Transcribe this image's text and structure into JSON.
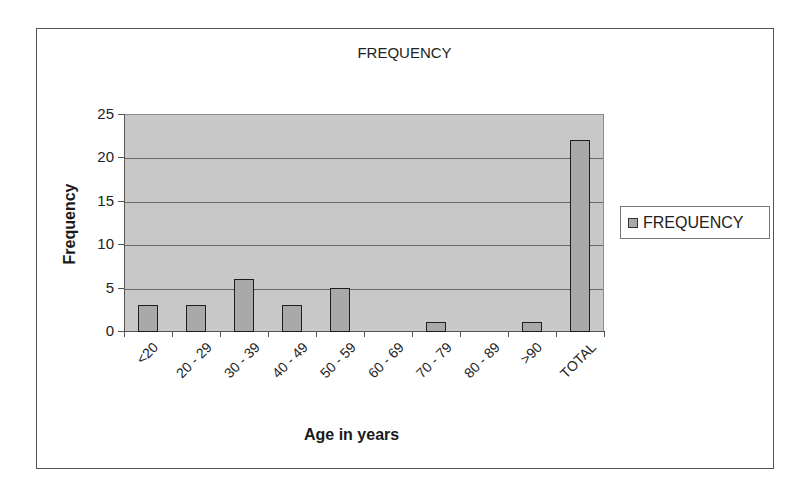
{
  "chart_data": {
    "type": "bar",
    "title": "FREQUENCY",
    "xlabel": "Age in years",
    "ylabel": "Frequency",
    "categories": [
      "<20",
      "20 - 29",
      "30 - 39",
      "40 - 49",
      "50 - 59",
      "60 - 69",
      "70 - 79",
      "80 - 89",
      ">90",
      "TOTAL"
    ],
    "series": [
      {
        "name": "FREQUENCY",
        "values": [
          3,
          3,
          6,
          3,
          5,
          0,
          1,
          0,
          1,
          22
        ]
      }
    ],
    "ylim": [
      0,
      25
    ],
    "yticks": [
      0,
      5,
      10,
      15,
      20,
      25
    ],
    "grid": true,
    "legend_position": "right",
    "colors": {
      "bar_fill": "#a9a9a9",
      "bar_border": "#1e1e1e",
      "plot_background": "#c8c8c8",
      "gridline": "#6a6a6a"
    }
  },
  "legend": {
    "label": "FREQUENCY"
  }
}
